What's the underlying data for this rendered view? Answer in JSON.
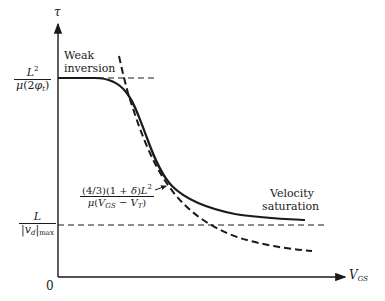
{
  "diagram": {
    "axes": {
      "y_label": "τ",
      "x_label": "V_GS",
      "origin_label": "0"
    },
    "y_levels": [
      {
        "name": "weak-inversion-level",
        "numerator": "L²",
        "denominator": "μ(2φ_t)"
      },
      {
        "name": "velocity-saturation-level",
        "numerator": "L",
        "denominator": "|v_d|max"
      }
    ],
    "annotations": {
      "weak_inversion_line1": "Weak",
      "weak_inversion_line2": "inversion",
      "velocity_saturation_line1": "Velocity",
      "velocity_saturation_line2": "saturation",
      "asymptote_numerator": "(4/3)(1 + δ)L²",
      "asymptote_denominator": "μ(V_GS − V_T)"
    },
    "curves": [
      {
        "name": "actual-transit-time",
        "style": "solid"
      },
      {
        "name": "strong-inversion-asymptote",
        "style": "dashed"
      },
      {
        "name": "weak-inversion-asymptote",
        "style": "dashed-horizontal"
      },
      {
        "name": "velocity-saturation-asymptote",
        "style": "dashed-horizontal"
      }
    ],
    "colors": {
      "ink": "#1a1a1a",
      "background": "#ffffff"
    }
  }
}
